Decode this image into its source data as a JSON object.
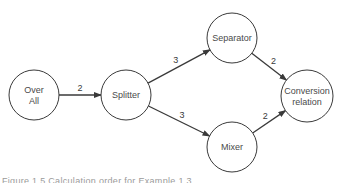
{
  "diagram": {
    "type": "directed-graph",
    "nodes": [
      {
        "id": "over_all",
        "label_lines": [
          "Over",
          "All"
        ],
        "cx": 34,
        "cy": 95,
        "r": 25
      },
      {
        "id": "splitter",
        "label_lines": [
          "Splitter"
        ],
        "cx": 126,
        "cy": 95,
        "r": 25
      },
      {
        "id": "separator",
        "label_lines": [
          "Separator"
        ],
        "cx": 232,
        "cy": 38,
        "r": 25
      },
      {
        "id": "mixer",
        "label_lines": [
          "Mixer"
        ],
        "cx": 232,
        "cy": 147,
        "r": 25
      },
      {
        "id": "conversion_relation",
        "label_lines": [
          "Conversion",
          "relation"
        ],
        "cx": 307,
        "cy": 96,
        "r": 26
      }
    ],
    "edges": [
      {
        "from": "over_all",
        "to": "splitter",
        "label": "2"
      },
      {
        "from": "splitter",
        "to": "separator",
        "label": "3"
      },
      {
        "from": "splitter",
        "to": "mixer",
        "label": "3"
      },
      {
        "from": "separator",
        "to": "conversion_relation",
        "label": "2"
      },
      {
        "from": "mixer",
        "to": "conversion_relation",
        "label": "2"
      }
    ],
    "colors": {
      "stroke": "#3a3a3a",
      "text": "#4a4a4a",
      "background": "#ffffff"
    }
  },
  "caption": {
    "text": "Figure 1.5  Calculation order for Example 1.3",
    "clipped": true
  }
}
